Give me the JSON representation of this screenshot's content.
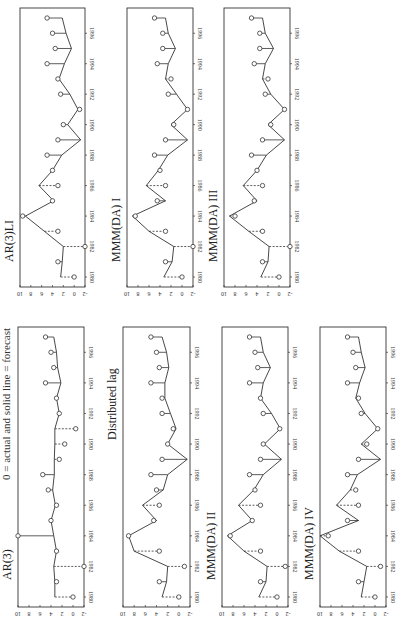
{
  "caption": "0 = actual and solid line = forecast",
  "colors": {
    "ink": "#333333",
    "background": "#ffffff"
  },
  "chart_data": [
    {
      "type": "line",
      "title": "AR(3)LI",
      "xlabel": "",
      "ylabel": "",
      "x": [
        1980,
        1981,
        1982,
        1983,
        1984,
        1985,
        1986,
        1987,
        1988,
        1989,
        1990,
        1991,
        1992,
        1993,
        1994,
        1995,
        1996,
        1997
      ],
      "series": [
        {
          "name": "Actual",
          "marker": "circle",
          "values": [
            0,
            3,
            -2,
            3,
            9.5,
            4,
            3,
            4,
            5,
            3,
            2,
            -1,
            2.5,
            3,
            5,
            3.5,
            4,
            5
          ]
        },
        {
          "name": "Forecast",
          "style": "solid",
          "values": [
            2.5,
            2.2,
            2,
            5.5,
            9,
            3.8,
            6.5,
            4,
            2.3,
            -1.2,
            1.2,
            -0.7,
            0.8,
            2.8,
            1.8,
            0.5,
            1.5,
            2.2
          ]
        }
      ],
      "ylim": [
        -2,
        10
      ],
      "yticks": [
        10,
        8,
        6,
        4,
        2,
        0,
        -2
      ],
      "xticks": [
        1980,
        1982,
        1984,
        1986,
        1988,
        1990,
        1992,
        1994,
        1996
      ],
      "panel": {
        "x": 20,
        "y": 8,
        "w": 65,
        "h": 279,
        "title_x": 13,
        "title_y": 262
      }
    },
    {
      "type": "line",
      "title": "MMM(DA) I",
      "xlabel": "",
      "ylabel": "",
      "x": [
        1980,
        1981,
        1982,
        1983,
        1984,
        1985,
        1986,
        1987,
        1988,
        1989,
        1990,
        1991,
        1992,
        1993,
        1994,
        1995,
        1996,
        1997
      ],
      "series": [
        {
          "name": "Actual",
          "marker": "circle",
          "values": [
            0,
            3,
            -2,
            3,
            8.5,
            4.5,
            3,
            4,
            5,
            3,
            1.5,
            -1,
            2.5,
            2,
            4.5,
            3.5,
            3.5,
            5
          ]
        },
        {
          "name": "Forecast",
          "style": "solid",
          "values": [
            3.3,
            1.8,
            1.5,
            6,
            9,
            3,
            6.5,
            4.3,
            2.6,
            -1,
            2,
            -1,
            1,
            3,
            2.5,
            1.2,
            2.5,
            3
          ]
        }
      ],
      "ylim": [
        -2,
        10
      ],
      "yticks": [
        10,
        8,
        6,
        4,
        2,
        0,
        -2
      ],
      "xticks": [
        1980,
        1982,
        1984,
        1986,
        1988,
        1990,
        1992,
        1994,
        1996
      ],
      "panel": {
        "x": 127,
        "y": 8,
        "w": 66,
        "h": 279,
        "title_x": 120,
        "title_y": 262
      }
    },
    {
      "type": "line",
      "title": "MMM(DA) III",
      "xlabel": "",
      "ylabel": "",
      "x": [
        1980,
        1981,
        1982,
        1983,
        1984,
        1985,
        1986,
        1987,
        1988,
        1989,
        1990,
        1991,
        1992,
        1993,
        1994,
        1995,
        1996,
        1997
      ],
      "series": [
        {
          "name": "Actual",
          "marker": "circle",
          "values": [
            0,
            3,
            -2,
            3,
            8,
            4.5,
            3,
            4,
            5,
            3,
            1.5,
            -1,
            2.5,
            2,
            4.5,
            3.5,
            3.5,
            5
          ]
        },
        {
          "name": "Forecast",
          "style": "solid",
          "values": [
            3.3,
            2,
            1.8,
            5.5,
            9,
            4,
            6.5,
            4,
            2.3,
            -1,
            2,
            -1,
            1.5,
            3,
            2.5,
            1,
            2.5,
            3
          ]
        }
      ],
      "ylim": [
        -2,
        10
      ],
      "yticks": [
        10,
        8,
        6,
        4,
        2,
        0,
        -2
      ],
      "xticks": [
        1980,
        1982,
        1984,
        1986,
        1988,
        1990,
        1992,
        1994,
        1996
      ],
      "panel": {
        "x": 224,
        "y": 8,
        "w": 66,
        "h": 279,
        "title_x": 217,
        "title_y": 262
      }
    },
    {
      "type": "line",
      "title": "AR(3)",
      "xlabel": "",
      "ylabel": "",
      "x": [
        1980,
        1981,
        1982,
        1983,
        1984,
        1985,
        1986,
        1987,
        1988,
        1989,
        1990,
        1991,
        1992,
        1993,
        1994,
        1995,
        1996,
        1997
      ],
      "series": [
        {
          "name": "Actual",
          "marker": "circle",
          "values": [
            0,
            3,
            -2,
            3,
            10,
            4,
            3,
            4.5,
            5.5,
            2.5,
            1.5,
            -0.5,
            2.5,
            3,
            5,
            3.5,
            4,
            5
          ]
        },
        {
          "name": "Forecast",
          "style": "solid",
          "values": [
            3.3,
            3.3,
            3.5,
            3,
            3.5,
            4,
            3.2,
            3.7,
            3.4,
            3.4,
            3.3,
            3.3,
            2.5,
            3,
            2.2,
            2.8,
            3,
            3.5
          ]
        }
      ],
      "ylim": [
        -2,
        10
      ],
      "yticks": [
        10,
        8,
        6,
        4,
        2,
        0,
        -2
      ],
      "xticks": [
        1980,
        1982,
        1984,
        1986,
        1988,
        1990,
        1992,
        1994,
        1996
      ],
      "panel": {
        "x": 18,
        "y": 327,
        "w": 66,
        "h": 280,
        "title_x": 11,
        "title_y": 580
      }
    },
    {
      "type": "line",
      "title": "Distributed lag",
      "xlabel": "",
      "ylabel": "",
      "x": [
        1980,
        1981,
        1982,
        1983,
        1984,
        1985,
        1986,
        1987,
        1988,
        1989,
        1990,
        1991,
        1992,
        1993,
        1994,
        1995,
        1996,
        1997
      ],
      "series": [
        {
          "name": "Actual",
          "marker": "circle",
          "values": [
            0,
            3.5,
            -1,
            3.5,
            9,
            4.5,
            3.5,
            4,
            5,
            3,
            2,
            1,
            3,
            3,
            5,
            3.5,
            4,
            5
          ]
        },
        {
          "name": "Forecast",
          "style": "solid",
          "values": [
            3,
            2.2,
            2,
            8,
            9,
            4,
            6.5,
            2.8,
            2,
            -1.5,
            2,
            0.5,
            1.5,
            2.5,
            2.5,
            1.8,
            2.2,
            3
          ]
        }
      ],
      "ylim": [
        -2,
        10
      ],
      "yticks": [
        10,
        8,
        6,
        4,
        2,
        0,
        -2
      ],
      "xticks": [
        1980,
        1982,
        1984,
        1986,
        1988,
        1990,
        1992,
        1994,
        1996
      ],
      "panel": {
        "x": 123,
        "y": 327,
        "w": 67,
        "h": 280,
        "title_x": 116,
        "title_y": 440
      }
    },
    {
      "type": "line",
      "title": "MMM(DA) II",
      "xlabel": "",
      "ylabel": "",
      "x": [
        1980,
        1981,
        1982,
        1983,
        1984,
        1985,
        1986,
        1987,
        1988,
        1989,
        1990,
        1991,
        1992,
        1993,
        1994,
        1995,
        1996,
        1997
      ],
      "series": [
        {
          "name": "Actual",
          "marker": "circle",
          "values": [
            0,
            3,
            -1.5,
            3,
            8.5,
            4.5,
            3,
            4,
            5,
            3,
            2.5,
            -0.5,
            2.5,
            3,
            5,
            3.5,
            4,
            5
          ]
        },
        {
          "name": "Forecast",
          "style": "solid",
          "values": [
            3.3,
            2,
            1.8,
            6,
            9,
            4.5,
            7,
            4.2,
            2.5,
            -0.8,
            2.3,
            -0.6,
            1,
            3,
            2.5,
            1.2,
            2.5,
            3
          ]
        }
      ],
      "ylim": [
        -2,
        10
      ],
      "yticks": [
        10,
        8,
        6,
        4,
        2,
        0,
        -2
      ],
      "xticks": [
        1980,
        1982,
        1984,
        1986,
        1988,
        1990,
        1992,
        1994,
        1996
      ],
      "panel": {
        "x": 222,
        "y": 327,
        "w": 66,
        "h": 280,
        "title_x": 215,
        "title_y": 580
      }
    },
    {
      "type": "line",
      "title": "MMM(DA) IV",
      "xlabel": "",
      "ylabel": "",
      "x": [
        1980,
        1981,
        1982,
        1983,
        1984,
        1985,
        1986,
        1987,
        1988,
        1989,
        1990,
        1991,
        1992,
        1993,
        1994,
        1995,
        1996,
        1997
      ],
      "series": [
        {
          "name": "Actual",
          "marker": "circle",
          "values": [
            0,
            3,
            -1,
            3,
            8.5,
            5,
            3,
            3.5,
            5,
            3,
            1.5,
            -0.5,
            2.5,
            3,
            5,
            3.5,
            4,
            5
          ]
        },
        {
          "name": "Forecast",
          "style": "solid",
          "values": [
            2.5,
            2,
            1.5,
            6.5,
            10,
            3,
            7,
            4.5,
            3.2,
            -1,
            2.5,
            -0.5,
            1.8,
            3.5,
            2.8,
            1.8,
            2.5,
            3
          ]
        }
      ],
      "ylim": [
        -2,
        10
      ],
      "yticks": [
        10,
        8,
        6,
        4,
        2,
        0,
        -2
      ],
      "xticks": [
        1980,
        1982,
        1984,
        1986,
        1988,
        1990,
        1992,
        1994,
        1996
      ],
      "panel": {
        "x": 320,
        "y": 327,
        "w": 66,
        "h": 280,
        "title_x": 313,
        "title_y": 580
      }
    }
  ]
}
